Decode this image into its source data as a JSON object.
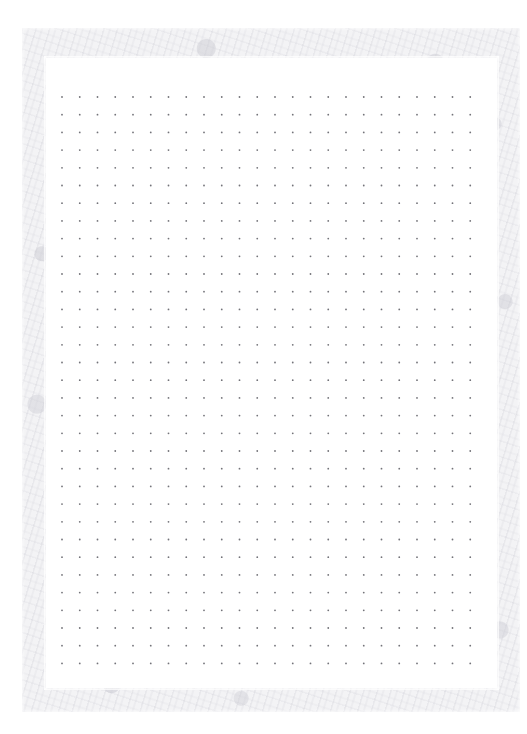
{
  "page": {
    "kind": "dot-grid-notebook-page",
    "width": 527,
    "height": 734,
    "background_color": "#ffffff",
    "text_content": ""
  },
  "frame": {
    "name": "textured-paper-border",
    "left": 22,
    "top": 28,
    "width": 498,
    "height": 684,
    "base_color": "#f3f3f5",
    "speckle_color": "#c8c8d0"
  },
  "sheet": {
    "name": "inner-white-sheet",
    "left": 46,
    "top": 58,
    "width": 451,
    "height": 630,
    "color": "#ffffff"
  },
  "grid": {
    "columns": 24,
    "rows": 33,
    "spacing_x": 17.75,
    "spacing_y": 17.7,
    "origin_x": 16,
    "origin_y": 39,
    "dot_radius": 0.9,
    "dot_color": "#5a5a62",
    "dot_opacity": 0.85
  },
  "labels": {
    "page_title": "",
    "header_text": "",
    "footer_text": ""
  }
}
